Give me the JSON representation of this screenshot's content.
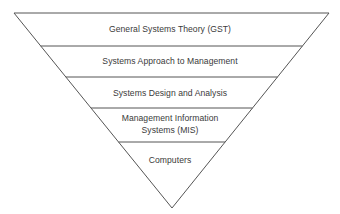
{
  "diagram": {
    "type": "inverted-pyramid",
    "line_color": "#555555",
    "background": "#ffffff",
    "layers": [
      {
        "lines": [
          "General Systems Theory (GST)"
        ]
      },
      {
        "lines": [
          "Systems Approach to Management"
        ]
      },
      {
        "lines": [
          "Systems Design and Analysis"
        ]
      },
      {
        "lines": [
          "Management Information",
          "Systems (MIS)"
        ]
      },
      {
        "lines": [
          "Computers"
        ]
      }
    ]
  }
}
